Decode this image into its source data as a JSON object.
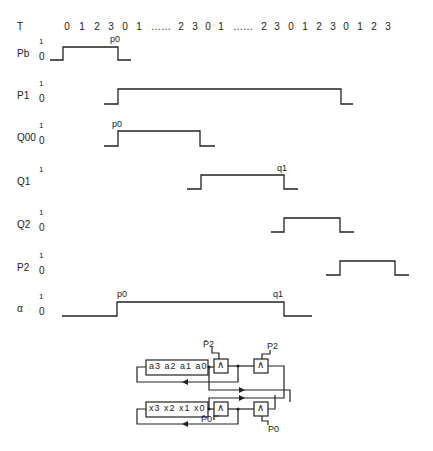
{
  "header": {
    "label": "T",
    "ticks": [
      {
        "t": "0",
        "x": 67
      },
      {
        "t": "1",
        "x": 82
      },
      {
        "t": "2",
        "x": 97
      },
      {
        "t": "3",
        "x": 111
      },
      {
        "t": "0",
        "x": 125
      },
      {
        "t": "1",
        "x": 139
      },
      {
        "t": "……",
        "x": 161
      },
      {
        "t": "2",
        "x": 181
      },
      {
        "t": "3",
        "x": 195
      },
      {
        "t": "0",
        "x": 208
      },
      {
        "t": "1",
        "x": 221
      },
      {
        "t": "……",
        "x": 243
      },
      {
        "t": "2",
        "x": 264
      },
      {
        "t": "3",
        "x": 277
      },
      {
        "t": "0",
        "x": 291
      },
      {
        "t": "1",
        "x": 305
      },
      {
        "t": "2",
        "x": 319
      },
      {
        "t": "3",
        "x": 333
      },
      {
        "t": "0",
        "x": 346
      },
      {
        "t": "1",
        "x": 360
      },
      {
        "t": "2",
        "x": 374
      },
      {
        "t": "3",
        "x": 388
      }
    ]
  },
  "signals": [
    {
      "name": "P0",
      "display": "Pb",
      "hi_label": "1",
      "lo_label": "0",
      "label_y": 47,
      "hi_y": 47,
      "lo_y": 60,
      "start": 50,
      "rise": 63,
      "fall": 118,
      "end": 131,
      "annotations": [
        {
          "text": "p0",
          "x": 110,
          "y": 34
        }
      ]
    },
    {
      "name": "P1",
      "display": "P1",
      "hi_label": "1",
      "lo_label": "0",
      "label_y": 89,
      "hi_y": 89,
      "lo_y": 104,
      "start": 104,
      "rise": 118,
      "fall": 341,
      "end": 353,
      "annotations": []
    },
    {
      "name": "Q0",
      "display": "Q00",
      "hi_label": "1",
      "lo_label": "0",
      "label_y": 131,
      "hi_y": 131,
      "lo_y": 146,
      "start": 104,
      "rise": 118,
      "fall": 200,
      "end": 215,
      "annotations": [
        {
          "text": "p0",
          "x": 112,
          "y": 119
        }
      ]
    },
    {
      "name": "Q1",
      "display": "Q1",
      "hi_label": "1",
      "lo_label": "",
      "label_y": 175,
      "hi_y": 175,
      "lo_y": 189,
      "start": 187,
      "rise": 201,
      "fall": 284,
      "end": 298,
      "annotations": [
        {
          "text": "q1",
          "x": 277,
          "y": 163
        }
      ]
    },
    {
      "name": "Q2",
      "display": "Q2",
      "hi_label": "1",
      "lo_label": "0",
      "label_y": 218,
      "hi_y": 218,
      "lo_y": 232,
      "start": 271,
      "rise": 284,
      "fall": 340,
      "end": 354,
      "annotations": []
    },
    {
      "name": "P2",
      "display": "P2",
      "hi_label": "1",
      "lo_label": "0",
      "label_y": 261,
      "hi_y": 261,
      "lo_y": 275,
      "start": 326,
      "rise": 340,
      "fall": 395,
      "end": 409,
      "annotations": []
    },
    {
      "name": "alpha",
      "display": "α",
      "hi_label": "1",
      "lo_label": "0",
      "label_y": 302,
      "hi_y": 302,
      "lo_y": 316,
      "start": 62,
      "rise": 117,
      "fall": 284,
      "end": 312,
      "annotations": [
        {
          "text": "p0",
          "x": 117,
          "y": 289
        },
        {
          "text": "q1",
          "x": 273,
          "y": 289
        }
      ]
    }
  ],
  "circuit": {
    "register_a": {
      "cells": [
        "a3",
        "a2",
        "a1",
        "a0"
      ]
    },
    "register_x": {
      "cells": [
        "x3",
        "x2",
        "x1",
        "x0"
      ]
    },
    "gate_symbol": "∧",
    "inputs": {
      "p2_bar": "P̄2",
      "p2": "P2",
      "p0_bar": "P̄0",
      "p0": "P0"
    }
  }
}
